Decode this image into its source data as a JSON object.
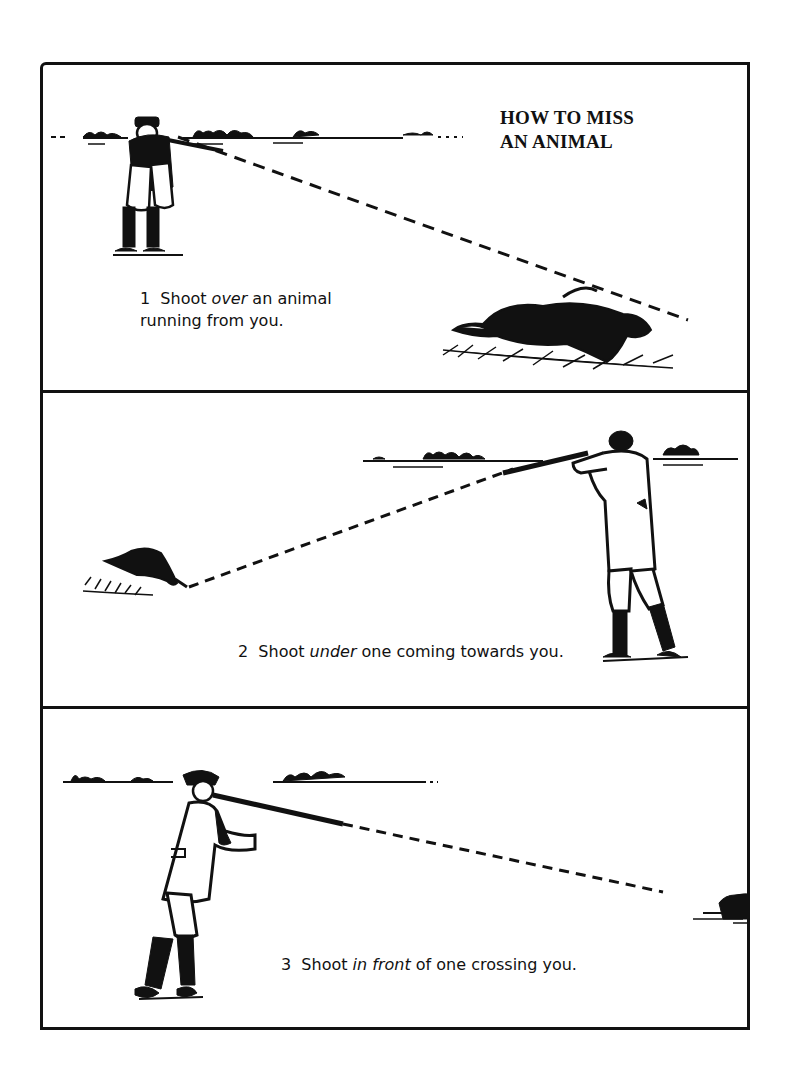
{
  "title": {
    "line1": "HOW TO MISS",
    "line2": "AN ANIMAL"
  },
  "panels": [
    {
      "number": "1",
      "caption_pre": "Shoot ",
      "caption_em": "over",
      "caption_post": " an animal",
      "caption_line2": "running from you.",
      "scene": "hunter-left-aiming-over-running-rabbit"
    },
    {
      "number": "2",
      "caption_pre": "Shoot ",
      "caption_em": "under",
      "caption_post": " one coming towards you.",
      "scene": "hunter-right-aiming-under-approaching-rabbit"
    },
    {
      "number": "3",
      "caption_pre": "Shoot ",
      "caption_em": "in front",
      "caption_post": " of one crossing you.",
      "scene": "hunter-left-aiming-ahead-of-crossing-rabbit"
    }
  ],
  "colors": {
    "ink": "#111111",
    "paper": "#ffffff"
  }
}
